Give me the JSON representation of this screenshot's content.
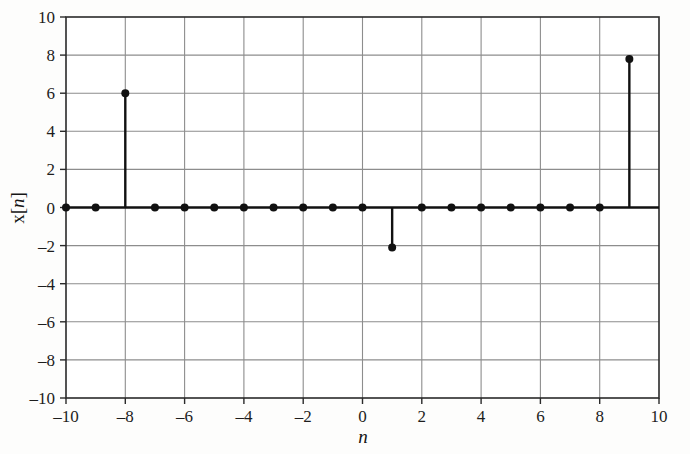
{
  "figure": {
    "background_color": "#fdfdfc",
    "ink_color": "#111111",
    "grid_color": "#8d8d8d",
    "axis_color": "#2a2a2a"
  },
  "axis_labels": {
    "x_title_text": "n",
    "y_title_prefix": "x[",
    "y_title_var": "n",
    "y_title_suffix": "]"
  },
  "chart_data": {
    "type": "scatter",
    "plot_style": "stem",
    "title": "",
    "xlabel": "n",
    "ylabel": "x[n]",
    "xlim": [
      -10,
      10
    ],
    "ylim": [
      -10,
      10
    ],
    "grid": true,
    "grid_step_x": 2,
    "grid_step_y": 2,
    "legend": "none",
    "xticks": [
      -10,
      -8,
      -6,
      -4,
      -2,
      0,
      2,
      4,
      6,
      8,
      10
    ],
    "xtick_labels": [
      "–10",
      "–8",
      "–6",
      "–4",
      "–2",
      "0",
      "2",
      "4",
      "6",
      "8",
      "10"
    ],
    "yticks": [
      -10,
      -8,
      -6,
      -4,
      -2,
      0,
      2,
      4,
      6,
      8,
      10
    ],
    "ytick_labels": [
      "–10",
      "–8",
      "–6",
      "–4",
      "–2",
      "0",
      "2",
      "4",
      "6",
      "8",
      "10"
    ],
    "baseline_y": 0,
    "x": [
      -10,
      -9,
      -8,
      -7,
      -6,
      -5,
      -4,
      -3,
      -2,
      -1,
      0,
      1,
      2,
      3,
      4,
      5,
      6,
      7,
      8,
      9
    ],
    "values": [
      0,
      0,
      6,
      0,
      0,
      0,
      0,
      0,
      0,
      0,
      0,
      -2.1,
      0,
      0,
      0,
      0,
      0,
      0,
      0,
      7.8
    ],
    "nonzero_points": [
      {
        "n": -8,
        "value": 6
      },
      {
        "n": 1,
        "value": -2.1
      },
      {
        "n": 9,
        "value": 7.8
      }
    ],
    "marker": "filled-circle",
    "marker_size": 4
  }
}
